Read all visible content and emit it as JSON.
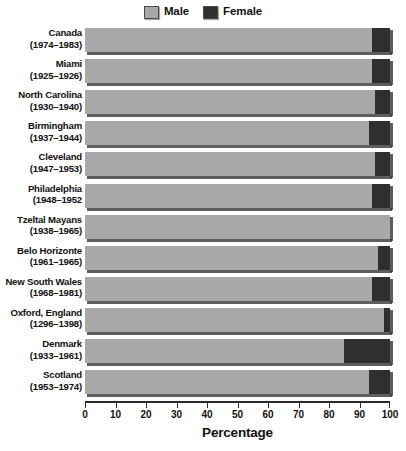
{
  "chart_data": {
    "type": "bar",
    "orientation": "horizontal",
    "stacked": true,
    "title": "",
    "xlabel": "Percentage",
    "ylabel": "",
    "xlim": [
      0,
      100
    ],
    "grid": false,
    "legend_position": "top-center",
    "tick_labels": [
      "0",
      "10",
      "20",
      "30",
      "40",
      "50",
      "60",
      "70",
      "80",
      "90",
      "100"
    ],
    "ticks": [
      0,
      10,
      20,
      30,
      40,
      50,
      60,
      70,
      80,
      90,
      100
    ],
    "legend": [
      {
        "name": "Male",
        "color": "#a8a8a8"
      },
      {
        "name": "Female",
        "color": "#2f2f2f"
      }
    ],
    "categories": [
      "Canada (1974–1983)",
      "Miami (1925–1926)",
      "North Carolina (1930–1940)",
      "Birmingham (1937–1944)",
      "Cleveland (1947–1953)",
      "Philadelphia (1948–1952",
      "Tzeltal Mayans (1938–1965)",
      "Belo Horizonte (1961–1965)",
      "New South Wales (1968–1981)",
      "Oxford, England (1296–1398)",
      "Denmark (1933–1961)",
      "Scotland (1953–1974)"
    ],
    "series": [
      {
        "name": "Male",
        "values": [
          94,
          94,
          95,
          93,
          95,
          94,
          100,
          96,
          94,
          98,
          85,
          93
        ]
      },
      {
        "name": "Female",
        "values": [
          6,
          6,
          5,
          7,
          5,
          6,
          0,
          4,
          6,
          2,
          15,
          7
        ]
      }
    ],
    "rows": [
      {
        "place": "Canada",
        "years": "(1974–1983)",
        "male": 94,
        "female": 6
      },
      {
        "place": "Miami",
        "years": "(1925–1926)",
        "male": 94,
        "female": 6
      },
      {
        "place": "North Carolina",
        "years": "(1930–1940)",
        "male": 95,
        "female": 5
      },
      {
        "place": "Birmingham",
        "years": "(1937–1944)",
        "male": 93,
        "female": 7
      },
      {
        "place": "Cleveland",
        "years": "(1947–1953)",
        "male": 95,
        "female": 5
      },
      {
        "place": "Philadelphia",
        "years": "(1948–1952",
        "male": 94,
        "female": 6
      },
      {
        "place": "Tzeltal Mayans",
        "years": "(1938–1965)",
        "male": 100,
        "female": 0
      },
      {
        "place": "Belo Horizonte",
        "years": "(1961–1965)",
        "male": 96,
        "female": 4
      },
      {
        "place": "New South Wales",
        "years": "(1968–1981)",
        "male": 94,
        "female": 6
      },
      {
        "place": "Oxford, England",
        "years": "(1296–1398)",
        "male": 98,
        "female": 2
      },
      {
        "place": "Denmark",
        "years": "(1933–1961)",
        "male": 85,
        "female": 15
      },
      {
        "place": "Scotland",
        "years": "(1953–1974)",
        "male": 93,
        "female": 7
      }
    ]
  }
}
